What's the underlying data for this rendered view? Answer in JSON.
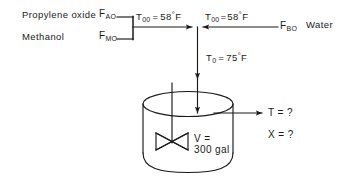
{
  "diagram": {
    "type": "process-flow-diagram",
    "stroke_color": "#1a1a1a",
    "background_color": "#ffffff",
    "feeds": [
      {
        "id": "feed-a",
        "name": "Propylene oxide",
        "flow_symbol": "F",
        "flow_subscript": "AO",
        "flow_label": "FAO"
      },
      {
        "id": "feed-m",
        "name": "Methanol",
        "flow_symbol": "F",
        "flow_subscript": "MO",
        "flow_label": "FMO"
      },
      {
        "id": "feed-b",
        "name": "Water",
        "flow_symbol": "F",
        "flow_subscript": "BO",
        "flow_label": "FBO"
      }
    ],
    "temperatures": [
      {
        "id": "t00-left",
        "symbol": "T",
        "subscript": "00",
        "equals": "=",
        "value": "58",
        "degree": "°",
        "unit": "F",
        "full": "T00 = 58°F"
      },
      {
        "id": "t00-right",
        "symbol": "T",
        "subscript": "00",
        "equals": "=",
        "value": "58",
        "degree": "°",
        "unit": "F",
        "full": "T00 = 58°F"
      },
      {
        "id": "t0-mixed",
        "symbol": "T",
        "subscript": "0",
        "equals": "=",
        "value": "75",
        "degree": "°",
        "unit": "F",
        "full": "T0 = 75°F"
      }
    ],
    "reactor": {
      "id": "cstr-tank",
      "volume_line1": "V =",
      "volume_line2": "300 gal",
      "volume_value": "300",
      "volume_unit": "gal",
      "agitator": "bowtie-impeller"
    },
    "outputs": [
      {
        "id": "outlet-temperature",
        "symbol": "T",
        "equals": "=",
        "value": "?",
        "full": "T = ?"
      },
      {
        "id": "outlet-conversion",
        "symbol": "X",
        "equals": "=",
        "value": "?",
        "full": "X = ?"
      }
    ]
  }
}
